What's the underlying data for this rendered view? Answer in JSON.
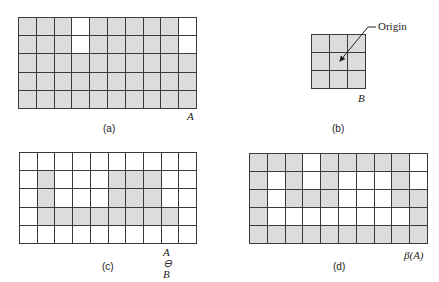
{
  "colors": {
    "fill": "#dcdcdc",
    "empty": "#ffffff",
    "line": "#3a3a3a"
  },
  "panels": [
    {
      "id": "a",
      "caption": "(a)",
      "set_label": "A",
      "rows": 5,
      "cols": 10,
      "cells": [
        [
          1,
          1,
          1,
          0,
          1,
          1,
          1,
          1,
          1,
          0
        ],
        [
          1,
          1,
          1,
          0,
          1,
          1,
          1,
          1,
          1,
          0
        ],
        [
          1,
          1,
          1,
          1,
          1,
          1,
          1,
          1,
          1,
          1
        ],
        [
          1,
          1,
          1,
          1,
          1,
          1,
          1,
          1,
          1,
          1
        ],
        [
          1,
          1,
          1,
          1,
          1,
          1,
          1,
          1,
          1,
          1
        ]
      ]
    },
    {
      "id": "b",
      "caption": "(b)",
      "set_label": "B",
      "annotation": "Origin",
      "rows": 3,
      "cols": 3,
      "cells": [
        [
          1,
          1,
          1
        ],
        [
          1,
          1,
          1
        ],
        [
          1,
          1,
          1
        ]
      ]
    },
    {
      "id": "c",
      "caption": "(c)",
      "set_label": "A ⊖ B",
      "rows": 5,
      "cols": 10,
      "cells": [
        [
          0,
          0,
          0,
          0,
          0,
          0,
          0,
          0,
          0,
          0
        ],
        [
          0,
          1,
          0,
          0,
          0,
          1,
          1,
          1,
          0,
          0
        ],
        [
          0,
          1,
          0,
          0,
          0,
          1,
          1,
          1,
          0,
          0
        ],
        [
          0,
          1,
          1,
          1,
          1,
          1,
          1,
          1,
          1,
          0
        ],
        [
          0,
          0,
          0,
          0,
          0,
          0,
          0,
          0,
          0,
          0
        ]
      ]
    },
    {
      "id": "d",
      "caption": "(d)",
      "set_label": "β(A)",
      "rows": 5,
      "cols": 10,
      "cells": [
        [
          1,
          1,
          1,
          0,
          1,
          1,
          1,
          1,
          1,
          0
        ],
        [
          1,
          0,
          1,
          0,
          1,
          0,
          0,
          0,
          1,
          0
        ],
        [
          1,
          0,
          1,
          1,
          1,
          0,
          0,
          0,
          1,
          1
        ],
        [
          1,
          0,
          0,
          0,
          0,
          0,
          0,
          0,
          0,
          1
        ],
        [
          1,
          1,
          1,
          1,
          1,
          1,
          1,
          1,
          1,
          1
        ]
      ]
    }
  ]
}
